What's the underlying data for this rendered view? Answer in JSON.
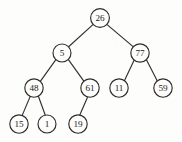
{
  "figure": {
    "type": "binary-tree-diagram",
    "background_color": "#fdfdfc",
    "stroke_color": "#2e2c2b",
    "label_color": "#1d1b1b",
    "node_radius": 9.2,
    "width": 182,
    "height": 142
  },
  "nodes": [
    {
      "id": "n26",
      "label": "26",
      "x": 100,
      "y": 18,
      "r": 9.4,
      "level": 0
    },
    {
      "id": "n5",
      "label": "5",
      "x": 62,
      "y": 53,
      "r": 9.0,
      "level": 1
    },
    {
      "id": "n77",
      "label": "77",
      "x": 140,
      "y": 53,
      "r": 9.2,
      "level": 1
    },
    {
      "id": "n48",
      "label": "48",
      "x": 34,
      "y": 88,
      "r": 9.2,
      "level": 2
    },
    {
      "id": "n61",
      "label": "61",
      "x": 90,
      "y": 88,
      "r": 9.2,
      "level": 2
    },
    {
      "id": "n11",
      "label": "11",
      "x": 119,
      "y": 88,
      "r": 9.2,
      "level": 2
    },
    {
      "id": "n59",
      "label": "59",
      "x": 163,
      "y": 88,
      "r": 9.2,
      "level": 2
    },
    {
      "id": "n15",
      "label": "15",
      "x": 19,
      "y": 124,
      "r": 9.2,
      "level": 3
    },
    {
      "id": "n1",
      "label": "1",
      "x": 47,
      "y": 124,
      "r": 9.0,
      "level": 3
    },
    {
      "id": "n19",
      "label": "19",
      "x": 78,
      "y": 124,
      "r": 9.2,
      "level": 3
    }
  ],
  "edges": [
    {
      "id": "e26-5",
      "from": "n26",
      "to": "n5",
      "x1": 93.2,
      "y1": 24.4,
      "x2": 68.6,
      "y2": 46.8
    },
    {
      "id": "e26-77",
      "from": "n26",
      "to": "n77",
      "x1": 106.8,
      "y1": 24.4,
      "x2": 133.4,
      "y2": 46.9
    },
    {
      "id": "e5-48",
      "from": "n5",
      "to": "n48",
      "x1": 55.9,
      "y1": 59.7,
      "x2": 40.3,
      "y2": 81.4
    },
    {
      "id": "e5-61",
      "from": "n5",
      "to": "n61",
      "x1": 68.4,
      "y1": 59.6,
      "x2": 84.0,
      "y2": 81.4
    },
    {
      "id": "e77-11",
      "from": "n77",
      "to": "n11",
      "x1": 134.2,
      "y1": 60.0,
      "x2": 124.4,
      "y2": 80.7
    },
    {
      "id": "e77-59",
      "from": "n77",
      "to": "n59",
      "x1": 146.3,
      "y1": 59.6,
      "x2": 157.2,
      "y2": 80.8
    },
    {
      "id": "e48-15",
      "from": "n48",
      "to": "n15",
      "x1": 30.2,
      "y1": 96.4,
      "x2": 22.2,
      "y2": 115.4
    },
    {
      "id": "e48-1",
      "from": "n48",
      "to": "n1",
      "x1": 38.4,
      "y1": 96.2,
      "x2": 45.3,
      "y2": 115.3
    },
    {
      "id": "e61-19",
      "from": "n61",
      "to": "n19",
      "x1": 87.6,
      "y1": 97.0,
      "x2": 79.7,
      "y2": 115.2
    }
  ]
}
